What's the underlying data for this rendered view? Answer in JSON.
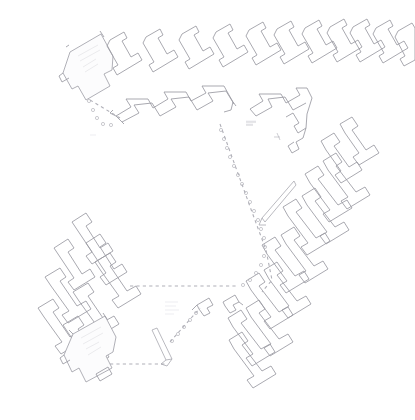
{
  "document": {
    "type": "architectural-site-plan",
    "title": "Residential Masterplan Site Plan",
    "background_color": "#ffffff",
    "line_color": "#9a9aa2",
    "faint_line_color": "#c0c0c8",
    "dashed_path_color": "#b0b0b8",
    "canvas": {
      "width": 415,
      "height": 420
    }
  },
  "plan": {
    "description": "Light-line CAD site plan showing rows of repeated L-shaped courtyard housing units arranged in a horseshoe around a central open space, linked by dashed pedestrian paths and dotted tree rows.",
    "clusters": [
      {
        "id": "north-row",
        "name": "North Terrace Row",
        "unit_count": 12,
        "orientation_deg": -12,
        "unit_type": "L-shaped row house"
      },
      {
        "id": "north-inner-row",
        "name": "North Inner Zigzag Row",
        "unit_count": 5,
        "orientation_deg": -12,
        "unit_type": "zigzag duplex"
      },
      {
        "id": "north-east-block",
        "name": "North-East Hook Block",
        "unit_count": 2,
        "orientation_deg": -12,
        "unit_type": "hook block"
      },
      {
        "id": "east-row",
        "name": "East Terrace Row",
        "unit_count": 7,
        "orientation_deg": 40,
        "unit_type": "L-shaped row house"
      },
      {
        "id": "south-east-row",
        "name": "South-East Terrace Row",
        "unit_count": 6,
        "orientation_deg": 40,
        "unit_type": "L-shaped row house"
      },
      {
        "id": "west-block",
        "name": "West Courtyard Cluster",
        "unit_count": 10,
        "orientation_deg": 40,
        "unit_type": "courtyard house"
      }
    ],
    "paths": [
      {
        "id": "path-central-spine",
        "name": "Central Dashed Spine",
        "style": "dashed"
      },
      {
        "id": "path-south-spur",
        "name": "South Dashed Spur",
        "style": "dashed"
      },
      {
        "id": "path-north-west-spur",
        "name": "North-West Dotted Spur",
        "style": "dotted"
      },
      {
        "id": "path-diagonal-walk",
        "name": "Diagonal Walkway",
        "style": "solid"
      }
    ],
    "courtyard": {
      "id": "central-open-space",
      "name": "Central Open Courtyard"
    },
    "scale_note": ""
  }
}
